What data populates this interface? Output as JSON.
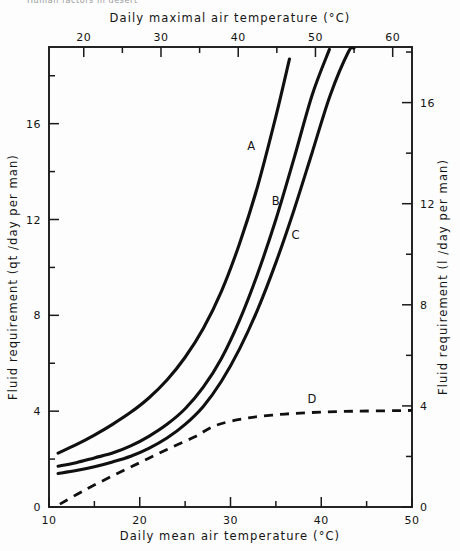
{
  "header": {
    "cropped_text": "Human factors in desert"
  },
  "chart_data": {
    "type": "line",
    "title": "",
    "xlabel": "Daily mean air temperature (°C)",
    "ylabel": "Fluid requirement (qt /day per man)",
    "xlabel_top": "Daily maximal air temperature (°C)",
    "ylabel_right": "Fluid requirement (l /day per man)",
    "xlim": [
      10,
      50
    ],
    "ylim": [
      0,
      19.2
    ],
    "xlim_top": [
      15.5,
      62.5
    ],
    "ylim_right": [
      0,
      18.2
    ],
    "grid": false,
    "legend": "inline-labels",
    "xticks": [
      10,
      20,
      30,
      40,
      50
    ],
    "xticklabels": [
      "10",
      "20",
      "30",
      "40",
      "50"
    ],
    "xticks_minor": [
      15,
      25,
      35,
      45
    ],
    "yticks": [
      0,
      4,
      8,
      12,
      16
    ],
    "yticklabels": [
      "0",
      "4",
      "8",
      "12",
      "16"
    ],
    "yticks_minor": [
      2,
      6,
      10,
      14,
      18
    ],
    "xticks_top": [
      20,
      30,
      40,
      50,
      60
    ],
    "xticklabels_top": [
      "20",
      "30",
      "40",
      "50",
      "60"
    ],
    "xticks_top_minor": [
      25,
      35,
      45,
      55
    ],
    "yticks_right": [
      0,
      4,
      8,
      12,
      16
    ],
    "yticklabels_right": [
      "0",
      "4",
      "8",
      "12",
      "16"
    ],
    "yticks_right_minor": [
      2,
      6,
      10,
      14,
      18
    ],
    "series": [
      {
        "name": "A",
        "label": "A",
        "style": "solid",
        "label_x": 32.3,
        "label_y": 14.9,
        "x": [
          11.0,
          13.0,
          15.0,
          17.0,
          19.0,
          21.0,
          23.0,
          25.0,
          27.0,
          29.0,
          31.0,
          33.0,
          35.0,
          36.5
        ],
        "y": [
          2.25,
          2.6,
          3.0,
          3.45,
          3.95,
          4.55,
          5.3,
          6.25,
          7.45,
          9.0,
          11.0,
          13.4,
          16.3,
          18.7
        ]
      },
      {
        "name": "B",
        "label": "B",
        "style": "solid",
        "label_x": 35.0,
        "label_y": 12.6,
        "x": [
          11.0,
          13.0,
          15.0,
          17.0,
          19.0,
          21.0,
          23.0,
          25.0,
          27.0,
          29.0,
          31.0,
          33.0,
          35.0,
          37.0,
          39.0,
          40.9
        ],
        "y": [
          1.7,
          1.85,
          2.05,
          2.25,
          2.55,
          2.95,
          3.45,
          4.1,
          5.0,
          6.2,
          7.8,
          9.75,
          12.0,
          14.55,
          17.2,
          19.1
        ]
      },
      {
        "name": "C",
        "label": "C",
        "style": "solid",
        "label_x": 37.2,
        "label_y": 11.2,
        "x": [
          11.0,
          13.0,
          15.0,
          17.0,
          19.0,
          21.0,
          23.0,
          25.0,
          27.0,
          29.0,
          31.0,
          33.0,
          35.0,
          37.0,
          39.0,
          41.0,
          43.0,
          43.6
        ],
        "y": [
          1.4,
          1.52,
          1.68,
          1.88,
          2.12,
          2.45,
          2.88,
          3.45,
          4.2,
          5.25,
          6.6,
          8.25,
          10.2,
          12.4,
          14.8,
          17.2,
          19.0,
          19.15
        ]
      },
      {
        "name": "D",
        "label": "D",
        "style": "dashed",
        "label_x": 39.0,
        "label_y": 4.35,
        "x": [
          11.2,
          14.0,
          17.0,
          20.0,
          23.0,
          26.0,
          28.5,
          32.0,
          36.0,
          40.0,
          44.0,
          48.0,
          50.0
        ],
        "y": [
          0.12,
          0.72,
          1.3,
          1.85,
          2.4,
          2.92,
          3.42,
          3.72,
          3.88,
          3.96,
          4.0,
          4.02,
          4.03
        ]
      }
    ]
  }
}
